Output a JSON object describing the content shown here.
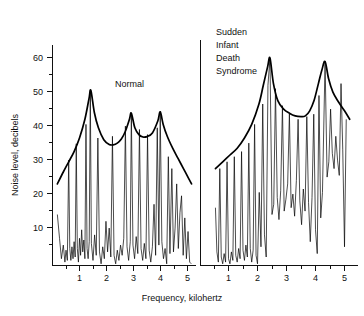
{
  "figure": {
    "xlabel": "Frequency, kilohertz",
    "ylabel": "Noise level, decibels"
  },
  "axes": {
    "y_ticks": [
      "10",
      "20",
      "30",
      "40",
      "50",
      "60"
    ],
    "x_ticks": [
      "1",
      "2",
      "3",
      "4",
      "5"
    ]
  },
  "panels": {
    "left": {
      "label": "Normal"
    },
    "right": {
      "label_line1": "Sudden",
      "label_line2": "Infant",
      "label_line3": "Death",
      "label_line4": "Syndrome"
    }
  },
  "chart_data": {
    "type": "line",
    "title": "",
    "xlabel": "Frequency, kilohertz",
    "ylabel": "Noise level, decibels",
    "xlim": [
      0,
      5.4
    ],
    "ylim": [
      0,
      68
    ],
    "xticks": [
      1,
      2,
      3,
      4,
      5
    ],
    "yticks": [
      10,
      20,
      30,
      40,
      50,
      60
    ],
    "grid": false,
    "legend": "none",
    "panels": [
      {
        "name": "Normal",
        "envelope": {
          "name": "Normal spectral envelope",
          "x": [
            0.18,
            0.4,
            0.6,
            0.8,
            1.0,
            1.2,
            1.35,
            1.42,
            1.55,
            1.7,
            1.9,
            2.1,
            2.25,
            2.4,
            2.55,
            2.7,
            2.85,
            2.92,
            3.05,
            3.2,
            3.35,
            3.5,
            3.7,
            3.9,
            3.99,
            4.1,
            4.25,
            4.45,
            4.65,
            4.85,
            5.05,
            5.15
          ],
          "y": [
            24.0,
            27.5,
            30.5,
            33.5,
            37.5,
            43.0,
            49.0,
            51.5,
            45.0,
            40.5,
            37.0,
            35.6,
            35.5,
            36.0,
            37.2,
            39.5,
            43.0,
            44.8,
            40.5,
            38.5,
            37.8,
            37.9,
            39.0,
            42.5,
            45.2,
            41.5,
            38.0,
            34.5,
            31.5,
            28.5,
            25.5,
            24.0
          ]
        },
        "spectrum": {
          "name": "Normal noise spectrum",
          "x": [
            0.18,
            0.26,
            0.33,
            0.4,
            0.46,
            0.5,
            0.55,
            0.6,
            0.64,
            0.68,
            0.72,
            0.76,
            0.8,
            0.84,
            0.88,
            0.92,
            0.96,
            1.0,
            1.04,
            1.08,
            1.12,
            1.16,
            1.2,
            1.24,
            1.28,
            1.32,
            1.36,
            1.4,
            1.44,
            1.5,
            1.56,
            1.62,
            1.68,
            1.74,
            1.8,
            1.86,
            1.92,
            1.98,
            2.04,
            2.1,
            2.16,
            2.22,
            2.28,
            2.34,
            2.4,
            2.46,
            2.52,
            2.58,
            2.64,
            2.7,
            2.76,
            2.82,
            2.88,
            2.92,
            2.98,
            3.04,
            3.1,
            3.16,
            3.22,
            3.28,
            3.34,
            3.4,
            3.46,
            3.52,
            3.58,
            3.64,
            3.7,
            3.76,
            3.82,
            3.88,
            3.94,
            3.99,
            4.05,
            4.11,
            4.17,
            4.23,
            4.29,
            4.35,
            4.42,
            4.48,
            4.54,
            4.6,
            4.66,
            4.72,
            4.78,
            4.84,
            4.9,
            4.96,
            5.02,
            5.08,
            5.14
          ],
          "y": [
            15.0,
            8.0,
            2.0,
            6.0,
            1.0,
            4.5,
            1.5,
            31.0,
            5.0,
            1.5,
            5.5,
            2.0,
            7.0,
            2.5,
            35.8,
            5.0,
            1.0,
            8.0,
            3.0,
            10.5,
            4.0,
            7.5,
            2.0,
            41.5,
            5.0,
            2.0,
            7.0,
            51.5,
            6.5,
            1.5,
            9.0,
            3.0,
            37.5,
            4.0,
            0.5,
            5.5,
            2.0,
            13.0,
            4.0,
            11.0,
            2.5,
            38.0,
            3.0,
            0.5,
            4.5,
            1.5,
            6.0,
            3.0,
            8.0,
            41.0,
            5.5,
            1.5,
            7.0,
            44.8,
            6.0,
            2.0,
            8.5,
            3.5,
            40.0,
            5.0,
            1.5,
            6.5,
            2.0,
            38.5,
            4.5,
            1.0,
            5.5,
            18.0,
            3.0,
            40.5,
            6.0,
            45.2,
            7.0,
            2.0,
            5.0,
            0.5,
            32.0,
            3.5,
            28.5,
            4.0,
            11.0,
            24.0,
            5.0,
            15.5,
            20.5,
            3.0,
            14.0,
            2.0,
            10.0,
            1.0,
            0.5
          ]
        }
      },
      {
        "name": "Sudden Infant Death Syndrome",
        "envelope": {
          "name": "SIDS spectral envelope",
          "x": [
            0.55,
            0.8,
            1.05,
            1.3,
            1.55,
            1.8,
            2.05,
            2.2,
            2.35,
            2.43,
            2.55,
            2.7,
            2.9,
            3.1,
            3.3,
            3.5,
            3.65,
            3.8,
            3.95,
            4.1,
            4.22,
            4.33,
            4.45,
            4.6,
            4.8,
            5.0,
            5.18
          ],
          "y": [
            28.5,
            30.5,
            32.5,
            34.5,
            37.5,
            41.5,
            47.5,
            53.0,
            58.5,
            61.0,
            53.5,
            48.5,
            46.0,
            44.8,
            44.0,
            43.8,
            44.0,
            45.5,
            48.5,
            53.5,
            57.5,
            60.0,
            55.0,
            51.0,
            48.0,
            45.5,
            43.0
          ]
        },
        "spectrum": {
          "name": "SIDS noise spectrum",
          "x": [
            0.55,
            0.6,
            0.65,
            0.7,
            0.75,
            0.8,
            0.85,
            0.9,
            0.95,
            1.0,
            1.05,
            1.1,
            1.15,
            1.2,
            1.25,
            1.3,
            1.35,
            1.4,
            1.45,
            1.5,
            1.55,
            1.6,
            1.65,
            1.7,
            1.75,
            1.8,
            1.85,
            1.9,
            1.95,
            2.0,
            2.06,
            2.12,
            2.18,
            2.24,
            2.3,
            2.36,
            2.43,
            2.5,
            2.56,
            2.62,
            2.68,
            2.74,
            2.8,
            2.86,
            2.92,
            2.98,
            3.04,
            3.1,
            3.16,
            3.22,
            3.28,
            3.34,
            3.4,
            3.46,
            3.52,
            3.58,
            3.64,
            3.7,
            3.76,
            3.82,
            3.88,
            3.94,
            4.0,
            4.06,
            4.12,
            4.18,
            4.24,
            4.33,
            4.4,
            4.46,
            4.52,
            4.58,
            4.64,
            4.7,
            4.76,
            4.82,
            4.88,
            4.94,
            5.0,
            5.06,
            5.12,
            5.18
          ],
          "y": [
            17.0,
            4.0,
            1.0,
            28.5,
            2.5,
            0.5,
            3.5,
            1.0,
            30.5,
            2.0,
            0.5,
            4.0,
            1.5,
            32.0,
            3.0,
            1.0,
            5.0,
            2.0,
            33.5,
            4.5,
            1.5,
            6.0,
            2.5,
            36.0,
            5.0,
            1.0,
            4.5,
            41.5,
            3.0,
            0.5,
            21.5,
            5.5,
            47.5,
            9.0,
            2.5,
            53.0,
            61.0,
            15.0,
            18.0,
            52.0,
            20.0,
            13.5,
            22.0,
            47.0,
            16.0,
            19.5,
            24.0,
            44.8,
            17.0,
            21.0,
            14.5,
            25.0,
            43.0,
            19.0,
            12.0,
            22.5,
            16.0,
            43.8,
            18.5,
            7.0,
            20.0,
            44.5,
            10.5,
            3.5,
            50.0,
            14.0,
            21.5,
            60.0,
            26.0,
            30.5,
            46.0,
            33.0,
            28.5,
            38.0,
            31.0,
            26.5,
            53.5,
            34.0,
            5.5,
            43.0
          ]
        }
      }
    ]
  }
}
